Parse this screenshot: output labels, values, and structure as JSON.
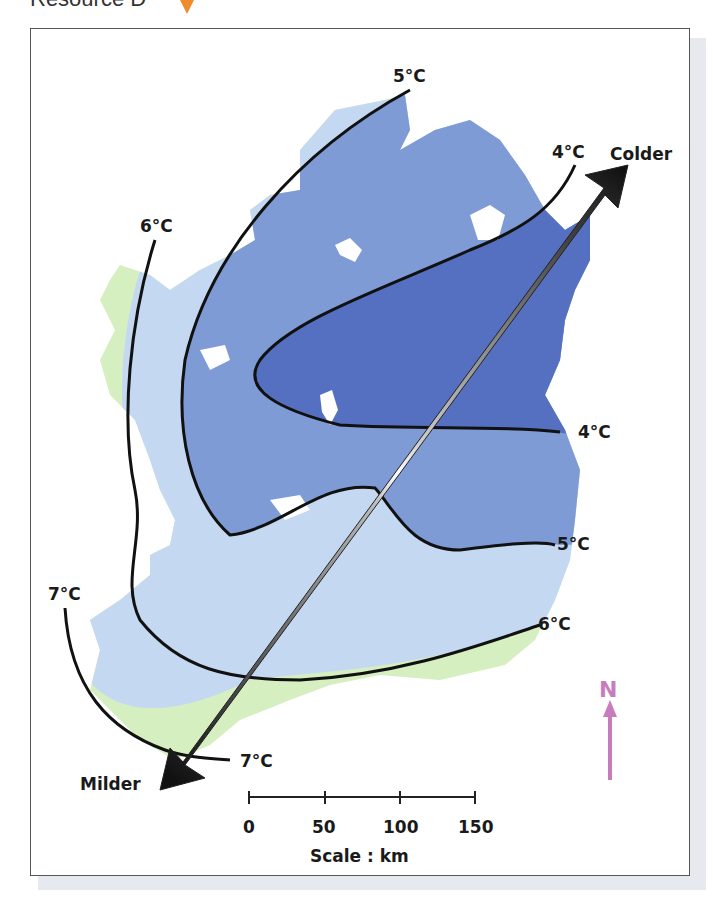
{
  "header": {
    "title": "Resource D"
  },
  "map": {
    "isotherms": [
      {
        "label": "5°C",
        "position": "top"
      },
      {
        "label": "4°C",
        "position": "northeast"
      },
      {
        "label": "6°C",
        "position": "northwest"
      },
      {
        "label": "4°C",
        "position": "east"
      },
      {
        "label": "5°C",
        "position": "east-lower"
      },
      {
        "label": "6°C",
        "position": "southeast"
      },
      {
        "label": "7°C",
        "position": "southwest"
      },
      {
        "label": "7°C",
        "position": "south"
      }
    ],
    "arrow": {
      "colder_label": "Colder",
      "milder_label": "Milder"
    },
    "north_label": "N",
    "colors": {
      "zone_4c": "#5570c0",
      "zone_5c": "#7e9bd6",
      "zone_6c": "#c5d8f2",
      "zone_7c": "#d5efc0",
      "north_arrow": "#c77dbd",
      "header_marker": "#f08a2a"
    }
  },
  "scale": {
    "ticks": [
      "0",
      "50",
      "100",
      "150"
    ],
    "caption": "Scale : km"
  }
}
